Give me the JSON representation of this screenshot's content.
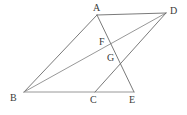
{
  "figure": {
    "width": 187,
    "height": 115,
    "background_color": "#ffffff",
    "stroke_color": "#6b6b6b",
    "stroke_color_light": "#8c8c8c",
    "label_color": "#3a3a3a",
    "stroke_width": 0.9
  },
  "points": {
    "A": {
      "label": "A",
      "x": 97,
      "y": 15,
      "label_x": 93,
      "label_y": 3
    },
    "B": {
      "label": "B",
      "x": 24,
      "y": 92,
      "label_x": 10,
      "label_y": 93
    },
    "C": {
      "label": "C",
      "x": 95,
      "y": 92,
      "label_x": 90,
      "label_y": 95
    },
    "D": {
      "label": "D",
      "x": 166,
      "y": 13,
      "label_x": 170,
      "label_y": 6
    },
    "E": {
      "label": "E",
      "x": 134,
      "y": 92,
      "label_x": 129,
      "label_y": 95
    },
    "F": {
      "label": "F",
      "x": 112,
      "y": 44,
      "label_x": 99,
      "label_y": 37
    },
    "G": {
      "label": "G",
      "x": 120,
      "y": 60,
      "label_x": 107,
      "label_y": 53
    }
  },
  "segments": [
    {
      "name": "segment-AD",
      "from": "A",
      "to": "D",
      "shade": "dark"
    },
    {
      "name": "segment-AB",
      "from": "A",
      "to": "B",
      "shade": "dark"
    },
    {
      "name": "segment-BE",
      "from": "B",
      "to": "E",
      "shade": "light"
    },
    {
      "name": "segment-BD",
      "from": "B",
      "to": "D",
      "shade": "light"
    },
    {
      "name": "segment-AE",
      "from": "A",
      "to": "E",
      "shade": "dark"
    },
    {
      "name": "segment-CD",
      "from": "C",
      "to": "D",
      "shade": "dark"
    }
  ],
  "labels_order": [
    "A",
    "D",
    "F",
    "G",
    "B",
    "C",
    "E"
  ]
}
